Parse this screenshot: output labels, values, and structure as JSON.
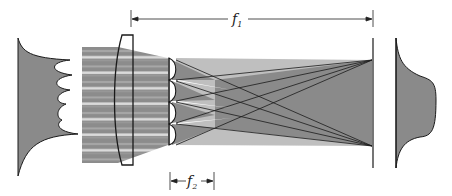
{
  "diagram": {
    "type": "optical-beam-homogenizer",
    "labels": {
      "f1": {
        "main": "f",
        "sub": "1"
      },
      "f2": {
        "main": "f",
        "sub": "2"
      }
    },
    "components": {
      "input_profile": "irregular-input-beam-profile",
      "beam": "striped-input-beam",
      "condenser_lens": "large-plano-convex-lens",
      "lenslet_array": {
        "count": 4
      },
      "screen": "output-plane",
      "output_profile": "flat-top-output-profile"
    },
    "colors": {
      "fill": "#8a8a8a",
      "stripe_light": "#d8d8d8",
      "stroke": "#1a1a1a",
      "background": "#ffffff"
    }
  }
}
